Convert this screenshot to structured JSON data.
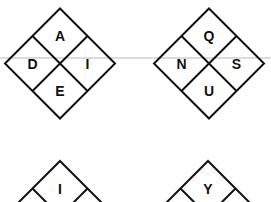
{
  "puzzle": {
    "diamonds": [
      {
        "id": "diamond-1",
        "cx": 60,
        "cy": 63.5,
        "r": 55,
        "cells": {
          "top": "A",
          "left": "D",
          "right": "I",
          "bottom": "E"
        }
      },
      {
        "id": "diamond-2",
        "cx": 209,
        "cy": 63.5,
        "r": 55,
        "cells": {
          "top": "Q",
          "left": "N",
          "right": "S",
          "bottom": "U"
        }
      },
      {
        "id": "diamond-3",
        "cx": 60,
        "cy": 216,
        "r": 55,
        "cells": {
          "top": "I",
          "left": "",
          "right": "",
          "bottom": ""
        }
      },
      {
        "id": "diamond-4",
        "cx": 208,
        "cy": 216,
        "r": 55,
        "cells": {
          "top": "Y",
          "left": "",
          "right": "",
          "bottom": ""
        }
      }
    ],
    "guide_line": {
      "y": 58,
      "color": "#cfcfcf"
    },
    "colors": {
      "stroke": "#111111",
      "background": "#ffffff"
    }
  }
}
